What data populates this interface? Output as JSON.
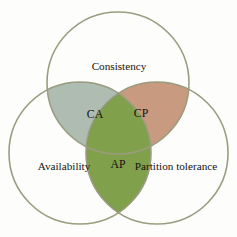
{
  "diagram": {
    "type": "venn-3-set",
    "background_color": "#fdfdfb",
    "circle_stroke_color": "#9b9d80",
    "sets": [
      {
        "key": "consistency",
        "label": "Consistency",
        "position": "top",
        "center": {
          "x": 118,
          "y": 83
        },
        "radius": 71,
        "label_position": {
          "x": 119,
          "y": 67
        }
      },
      {
        "key": "availability",
        "label": "Availability",
        "position": "bottom-left",
        "center": {
          "x": 80,
          "y": 153
        },
        "radius": 71,
        "label_position": {
          "x": 64,
          "y": 167
        }
      },
      {
        "key": "partition_tolerance",
        "label": "Partition tolerance",
        "position": "bottom-right",
        "center": {
          "x": 157,
          "y": 153
        },
        "radius": 71,
        "label_position": {
          "x": 176,
          "y": 167
        }
      }
    ],
    "intersections": [
      {
        "key": "ca",
        "label": "CA",
        "sets": [
          "consistency",
          "availability"
        ],
        "fill_color": "#aebcb2",
        "stroke_color": "#7d8e84",
        "label_position": {
          "x": 95,
          "y": 115
        }
      },
      {
        "key": "cp",
        "label": "CP",
        "sets": [
          "consistency",
          "partition_tolerance"
        ],
        "fill_color": "#c89a80",
        "stroke_color": "#9d6a4c",
        "label_position": {
          "x": 141,
          "y": 114
        }
      },
      {
        "key": "ap",
        "label": "AP",
        "sets": [
          "availability",
          "partition_tolerance"
        ],
        "fill_color": "#80a04c",
        "stroke_color": "#5e7c33",
        "label_position": {
          "x": 118,
          "y": 165
        }
      }
    ]
  }
}
